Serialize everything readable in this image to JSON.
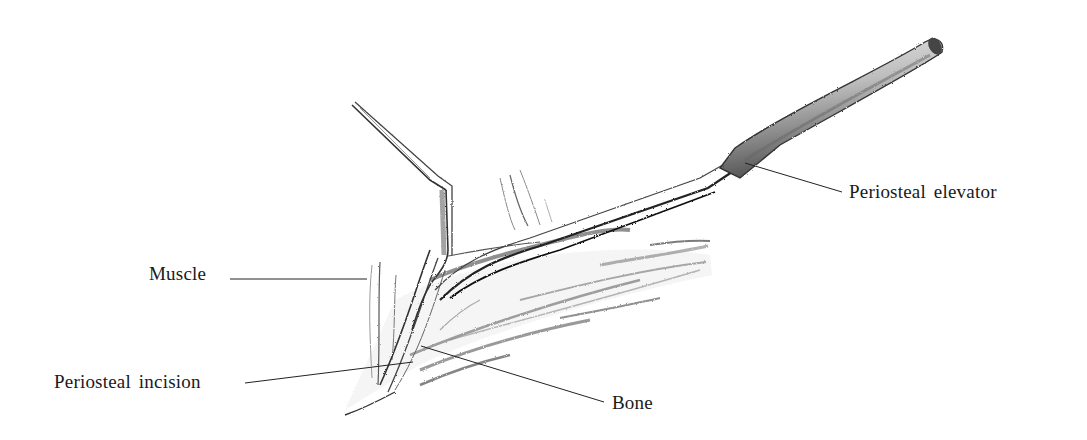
{
  "figure": {
    "labels": {
      "periosteal_elevator": "Periosteal elevator",
      "muscle": "Muscle",
      "periosteal_incision": "Periosteal incision",
      "bone": "Bone"
    },
    "colors": {
      "background": "#ffffff",
      "ink": "#1a1a1a",
      "shading": "#555555"
    }
  }
}
